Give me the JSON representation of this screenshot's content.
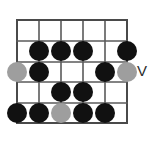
{
  "diagram": {
    "type": "guitar-scale-fretboard",
    "colors": {
      "grid": "#5a5a5a",
      "grid_edge": "#4a4a4a",
      "note_normal": "#111111",
      "note_muted": "#9e9e9e",
      "background": "#ffffff",
      "marker_text": "#2b2b2b"
    },
    "grid": {
      "columns": 5,
      "rows": 5,
      "x_lines": [
        17,
        39,
        61,
        83,
        105,
        127
      ],
      "y_lines": [
        20,
        41,
        62,
        82,
        103,
        123
      ],
      "left": 17,
      "top": 20,
      "right": 127,
      "bottom": 123
    },
    "dot_radius": 10,
    "notes": [
      {
        "name": "note-r2-c2",
        "x": 39,
        "y": 51,
        "kind": "normal"
      },
      {
        "name": "note-r2-c3",
        "x": 61,
        "y": 51,
        "kind": "normal"
      },
      {
        "name": "note-r2-c4",
        "x": 83,
        "y": 51,
        "kind": "normal"
      },
      {
        "name": "note-r2-c6",
        "x": 127,
        "y": 51,
        "kind": "normal"
      },
      {
        "name": "note-r3-c1",
        "x": 17,
        "y": 72,
        "kind": "muted"
      },
      {
        "name": "note-r3-c2",
        "x": 39,
        "y": 72,
        "kind": "normal"
      },
      {
        "name": "note-r3-c5",
        "x": 105,
        "y": 72,
        "kind": "normal"
      },
      {
        "name": "note-r3-c6",
        "x": 127,
        "y": 72,
        "kind": "muted"
      },
      {
        "name": "note-r4-c3",
        "x": 61,
        "y": 92,
        "kind": "normal"
      },
      {
        "name": "note-r4-c4",
        "x": 83,
        "y": 92,
        "kind": "normal"
      },
      {
        "name": "note-r5-c1",
        "x": 17,
        "y": 113,
        "kind": "normal"
      },
      {
        "name": "note-r5-c2",
        "x": 39,
        "y": 113,
        "kind": "normal"
      },
      {
        "name": "note-r5-c3",
        "x": 61,
        "y": 113,
        "kind": "muted"
      },
      {
        "name": "note-r5-c4",
        "x": 83,
        "y": 113,
        "kind": "normal"
      },
      {
        "name": "note-r5-c5",
        "x": 105,
        "y": 113,
        "kind": "normal"
      }
    ],
    "position_marker": {
      "label": "V",
      "x": 142,
      "y": 72
    }
  }
}
